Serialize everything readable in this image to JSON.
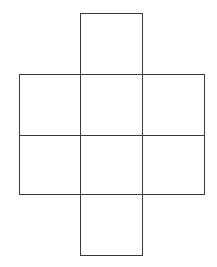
{
  "diagram": {
    "title": "",
    "stroke_color": "#3a3a3a",
    "background_color": "#ffffff",
    "grid": {
      "col_edges_px": [
        19,
        80,
        142,
        204
      ],
      "row_edges_px": [
        13,
        74,
        135,
        194,
        255
      ]
    },
    "cells": [
      {
        "id": "top",
        "col": 1,
        "row": 0,
        "label": ""
      },
      {
        "id": "middle-left",
        "col": 0,
        "row": 1,
        "label": ""
      },
      {
        "id": "middle-center",
        "col": 1,
        "row": 1,
        "label": ""
      },
      {
        "id": "middle-right",
        "col": 2,
        "row": 1,
        "label": ""
      },
      {
        "id": "lower-left",
        "col": 0,
        "row": 2,
        "label": ""
      },
      {
        "id": "lower-center",
        "col": 1,
        "row": 2,
        "label": ""
      },
      {
        "id": "lower-right",
        "col": 2,
        "row": 2,
        "label": ""
      },
      {
        "id": "bottom",
        "col": 1,
        "row": 3,
        "label": ""
      }
    ]
  }
}
